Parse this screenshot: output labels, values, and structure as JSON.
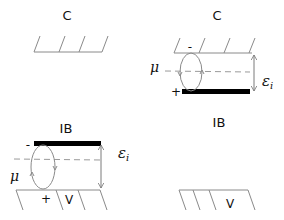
{
  "panels": {
    "top_left": {
      "title": "C",
      "description": "Contact electrode (C) surface, isolated"
    },
    "top_right": {
      "title": "C",
      "mu_label": "μ",
      "epsilon_label": "ε",
      "epsilon_subscript": "i",
      "minus_sign": "-",
      "plus_sign": "+"
    },
    "bottom_left": {
      "title": "IB",
      "mu_label": "μ",
      "epsilon_label": "ε",
      "epsilon_subscript": "i",
      "minus_sign": "-",
      "plus_sign": "+",
      "surface_label": "V"
    },
    "bottom_right": {
      "title": "IB",
      "surface_label": "V"
    }
  },
  "colors": {
    "line": "#8a8a8a",
    "bar": "#000000",
    "text": "#111111",
    "dashed": "#9a9a9a"
  }
}
